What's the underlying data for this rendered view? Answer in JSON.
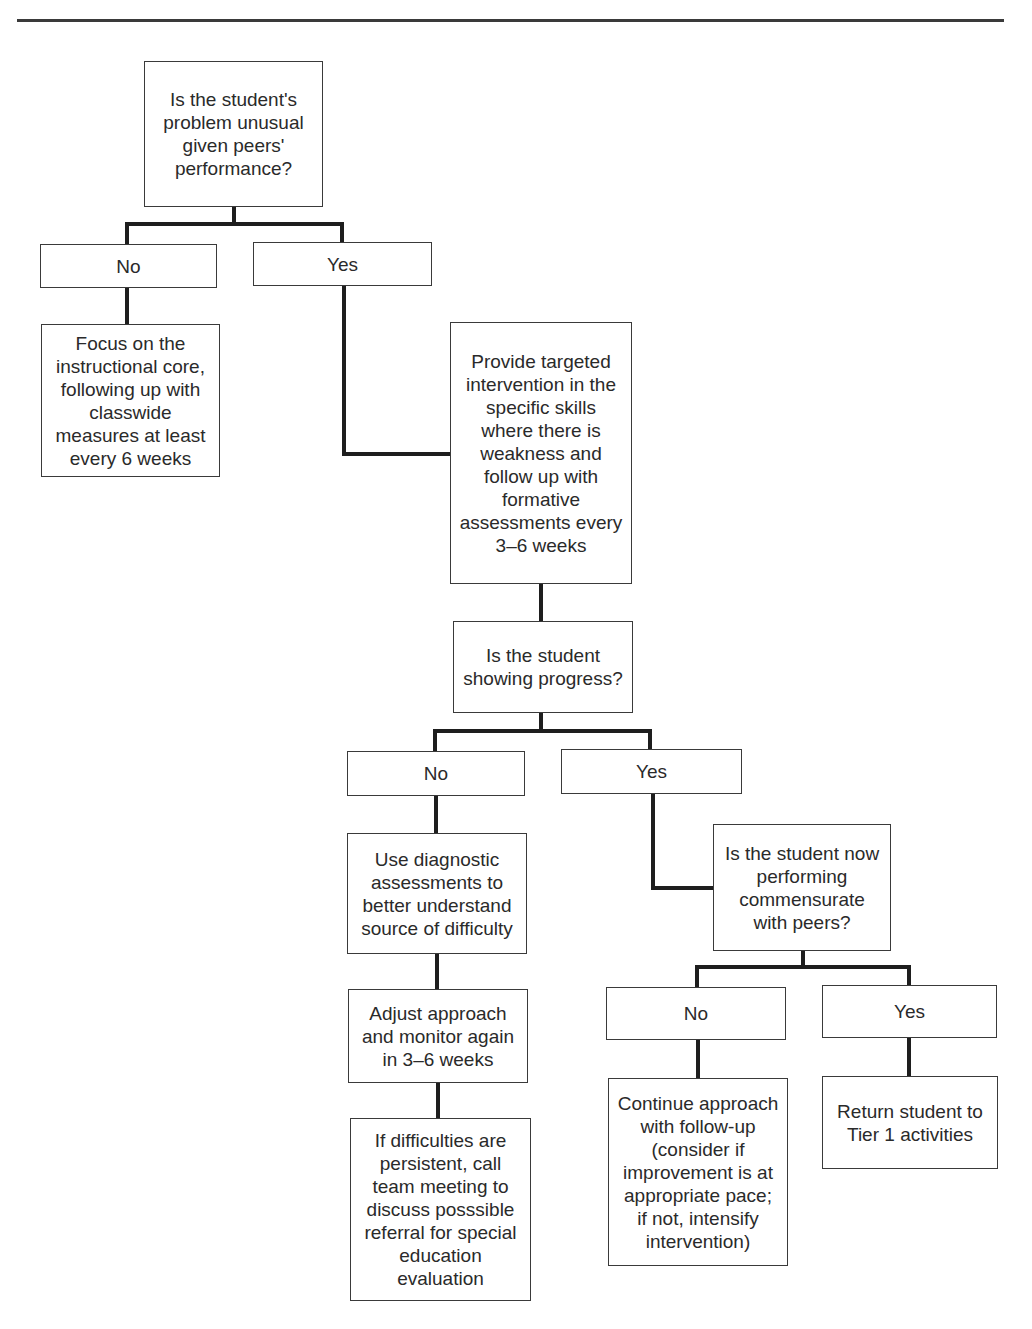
{
  "nodes": {
    "q1": "Is the student's\nproblem unusual\ngiven peers'\nperformance?",
    "q1_no": "No",
    "q1_yes": "Yes",
    "focus_core": "Focus on the\ninstructional core,\nfollowing up with\nclasswide\nmeasures at least\nevery 6 weeks",
    "targeted_intervention": "Provide targeted\nintervention in the\nspecific skills\nwhere there is\nweakness and\nfollow up with\nformative\nassessments every\n3–6 weeks",
    "q2": "Is the student\nshowing progress?",
    "q2_no": "No",
    "q2_yes": "Yes",
    "diagnostic": "Use diagnostic\nassessments to\nbetter understand\nsource of difficulty",
    "adjust": "Adjust approach\nand monitor again\nin 3–6 weeks",
    "referral": "If difficulties are\npersistent, call\nteam meeting to\ndiscuss posssible\nreferral for special\neducation\nevaluation",
    "q3": "Is the student now\nperforming\ncommensurate\nwith peers?",
    "q3_no": "No",
    "q3_yes": "Yes",
    "continue": "Continue approach\nwith follow-up\n(consider if\nimprovement is at\nappropriate pace;\nif not, intensify\nintervention)",
    "return_tier1": "Return student to\nTier 1 activities"
  }
}
